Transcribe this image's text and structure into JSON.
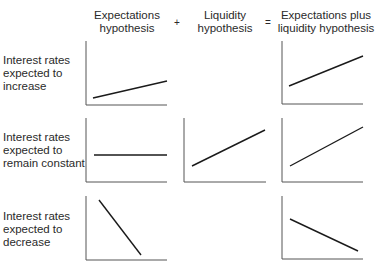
{
  "columns": [
    {
      "line1": "Expectations",
      "line2": "hypothesis"
    },
    {
      "line1": "Liquidity",
      "line2": "hypothesis"
    },
    {
      "line1": "Expectations plus",
      "line2": "liquidity hypothesis"
    }
  ],
  "operators": {
    "plus": "+",
    "equals": "="
  },
  "rows": [
    {
      "line1": "Interest rates",
      "line2": "expected to",
      "line3": "increase"
    },
    {
      "line1": "Interest rates",
      "line2": "expected to",
      "line3": "remain constant"
    },
    {
      "line1": "Interest rates",
      "line2": "expected to",
      "line3": "decrease"
    }
  ],
  "panels": [
    {
      "row": 0,
      "col": 0,
      "slope": "rising-gentle"
    },
    {
      "row": 0,
      "col": 2,
      "slope": "rising-steeper"
    },
    {
      "row": 1,
      "col": 0,
      "slope": "flat"
    },
    {
      "row": 1,
      "col": 1,
      "slope": "rising"
    },
    {
      "row": 1,
      "col": 2,
      "slope": "rising"
    },
    {
      "row": 2,
      "col": 0,
      "slope": "falling-steep"
    },
    {
      "row": 2,
      "col": 2,
      "slope": "falling-gentle"
    }
  ],
  "colors": {
    "axis": "#555555",
    "line": "#1a1a1a",
    "text": "#2a2a2a"
  }
}
